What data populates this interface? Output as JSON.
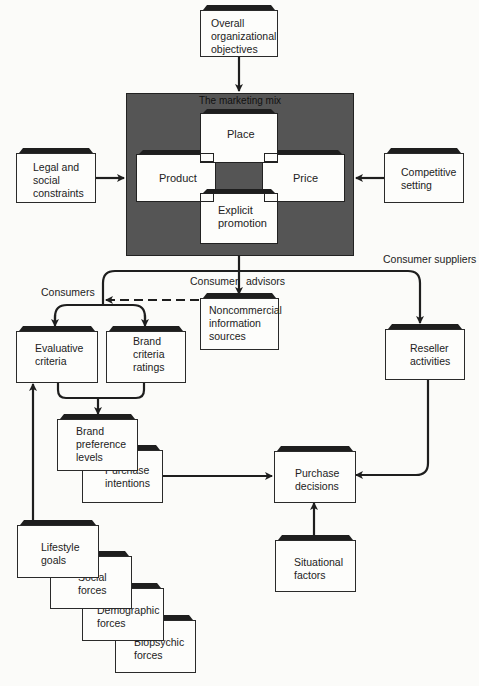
{
  "diagram": {
    "type": "flow diagram",
    "top": {
      "objectives": "Overall organizational objectives"
    },
    "marketing_mix": {
      "title": "The marketing mix",
      "elements": {
        "place": "Place",
        "product": "Product",
        "price": "Price",
        "promotion": "Explicit promotion"
      }
    },
    "inputs": {
      "legal": "Legal and social constraints",
      "competitive": "Competitive setting"
    },
    "flow_labels": {
      "consumer_advisors_left": "Consumer",
      "consumer_advisors_right": "advisors",
      "consumer_suppliers": "Consumer suppliers",
      "consumers": "Consumers"
    },
    "nodes": {
      "noncommercial": "Noncommercial information sources",
      "evaluative": "Evaluative criteria",
      "brand_ratings": "Brand criteria ratings",
      "reseller": "Reseller activities",
      "brand_preference": "Brand preference levels",
      "purchase_intentions": "Purchase intentions",
      "purchase_decisions": "Purchase decisions",
      "situational": "Situational factors",
      "lifestyle": "Lifestyle goals",
      "social": "Social forces",
      "demographic": "Demographic forces",
      "biopsychic": "Biopsychic forces"
    },
    "lines": {
      "objectives_text": [
        "Overall",
        "organizational",
        "objectives"
      ],
      "legal_text": [
        "Legal and",
        "social",
        "constraints"
      ],
      "competitive_text": [
        "Competitive",
        "setting"
      ],
      "promotion_text": [
        "Explicit",
        "promotion"
      ],
      "noncommercial_text": [
        "Noncommercial",
        "information",
        "sources"
      ],
      "evaluative_text": [
        "Evaluative",
        "criteria"
      ],
      "brand_ratings_text": [
        "Brand",
        "criteria",
        "ratings"
      ],
      "reseller_text": [
        "Reseller",
        "activities"
      ],
      "brand_preference_text": [
        "Brand",
        "preference",
        "levels"
      ],
      "purchase_intentions_text": [
        "Purchase",
        "intentions"
      ],
      "purchase_decisions_text": [
        "Purchase",
        "decisions"
      ],
      "situational_text": [
        "Situational",
        "factors"
      ],
      "lifestyle_text": [
        "Lifestyle",
        "goals"
      ],
      "social_text": [
        "Social",
        "forces"
      ],
      "demographic_text": [
        "Demographic",
        "forces"
      ],
      "biopsychic_text": [
        "Biopsychic",
        "forces"
      ]
    }
  }
}
